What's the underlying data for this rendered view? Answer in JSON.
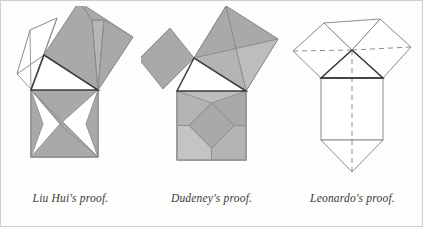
{
  "page": {
    "background_color": "#fdfdfc",
    "frame_color": "#cfcfcb",
    "width": 424,
    "height": 228
  },
  "palette": {
    "stroke_light": "#8c8c8c",
    "stroke_dark": "#3c3c3c",
    "fill_white": "#ffffff",
    "fill_mid_gray": "#a9a9a9",
    "fill_light_gray": "#c4c4c4",
    "fill_pale_gray": "#bdbdbd",
    "dash_color": "#8c8c8c"
  },
  "figures": [
    {
      "id": "liu-hui",
      "caption": "Liu Hui's proof.",
      "description": "Right triangle with squares on all three sides; the two smaller squares are dissected into shaded pieces that are rearranged to fill the square on the hypotenuse."
    },
    {
      "id": "dudeney",
      "caption": "Dudeney's proof.",
      "description": "Right triangle with squares on all three sides; the medium square is cut by two perpendicular lines through its center into four congruent quadrilaterals which, with the small square, tile the large square."
    },
    {
      "id": "leonardo",
      "caption": "Leonardo's proof.",
      "description": "Right triangle with squares on all three sides plus a mirrored triangle; dashed lines mark the axis of symmetry and the congruent hexagon halves."
    }
  ],
  "captions": {
    "liu_hui": "Liu Hui's proof.",
    "dudeney": "Dudeney's proof.",
    "leonardo": "Leonardo's proof."
  }
}
